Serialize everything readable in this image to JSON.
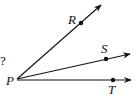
{
  "diagram": {
    "question_fragment": "?",
    "vertex": {
      "label": "P",
      "x": 17,
      "y": 79
    },
    "rays": [
      {
        "name": "ray-PR",
        "point_label": "R",
        "dot": [
          81,
          23
        ],
        "tip": [
          101,
          5
        ],
        "label_pos": [
          68,
          24
        ]
      },
      {
        "name": "ray-PS",
        "point_label": "S",
        "dot": [
          106,
          59
        ],
        "tip": [
          130,
          54
        ],
        "label_pos": [
          101,
          53
        ]
      },
      {
        "name": "ray-PT",
        "point_label": "T",
        "dot": [
          113,
          80
        ],
        "tip": [
          131,
          80
        ],
        "label_pos": [
          108,
          94
        ]
      }
    ],
    "colors": {
      "line": "#111111",
      "background": "#ffffff"
    }
  }
}
